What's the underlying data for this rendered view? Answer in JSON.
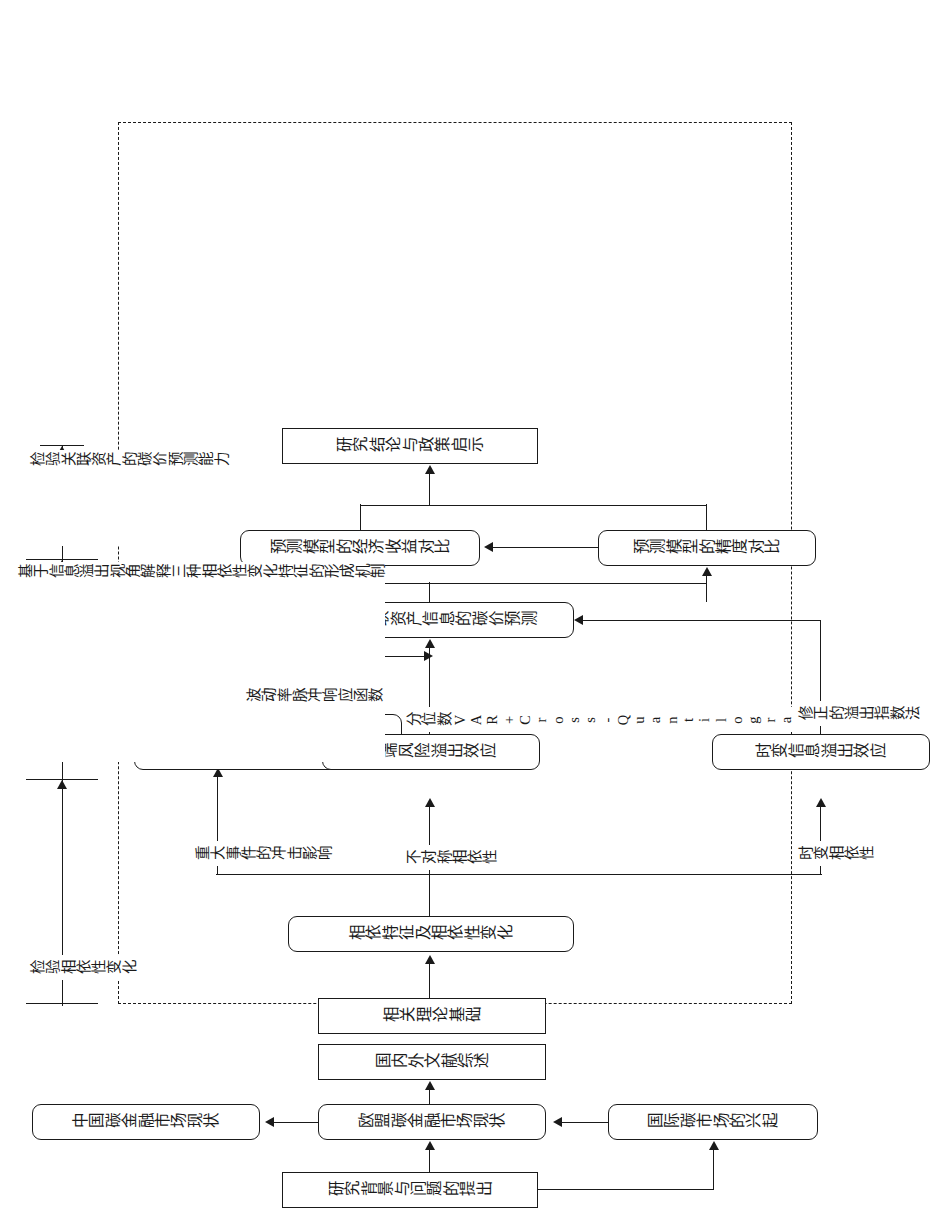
{
  "figure": {
    "type": "research-framework-flowchart",
    "orientation": "rotated-90-landscape-on-portrait-page",
    "line_color": "#1a1a1a",
    "background": "#ffffff"
  },
  "objectives": {
    "items": [
      {
        "id": "obj1",
        "text": "检验相依性变化"
      },
      {
        "id": "obj2",
        "text": "基于信息溢出视角解释三种相依性变化特征的形成机制"
      },
      {
        "id": "obj3",
        "text": "检验关联资产的碳价预测能力"
      }
    ]
  },
  "nodes": {
    "intro": {
      "text": "研究背景与问题的提出"
    },
    "intl_market": {
      "text": "国际碳市场的兴起"
    },
    "eu_market": {
      "text": "欧盟碳金融市场现状"
    },
    "cn_market": {
      "text": "中国碳金融市场现状"
    },
    "literature": {
      "text": "国内外文献综述"
    },
    "theory": {
      "text": "相关理论基础"
    },
    "dependence": {
      "text": "相依特征及相依性变化"
    },
    "tv_spillover": {
      "text": "时变信息溢出效应"
    },
    "extreme_risk": {
      "text": "极端风险溢出效应"
    },
    "event_shock": {
      "text": "重大事件对波动溢出效应的冲击"
    },
    "forecast": {
      "text": "基于关联资产信息的碳价预测"
    },
    "accuracy": {
      "text": "预测模型的精度对比"
    },
    "economic": {
      "text": "预测模型的经济收益对比"
    },
    "conclusion": {
      "text": "研究结论与政策启示"
    }
  },
  "edge_labels": {
    "time_varying": {
      "text": "时变相依性"
    },
    "asymmetric": {
      "text": "不对称相依性"
    },
    "major_event": {
      "text": "重大事件的冲击影响"
    },
    "spillover_idx": {
      "text": "修正的溢出指数法"
    },
    "qvar_cq": {
      "text": "分位数VAR+Cross-Quantilogram"
    },
    "vol_irf": {
      "text": "波动率脉冲响应函数"
    }
  }
}
